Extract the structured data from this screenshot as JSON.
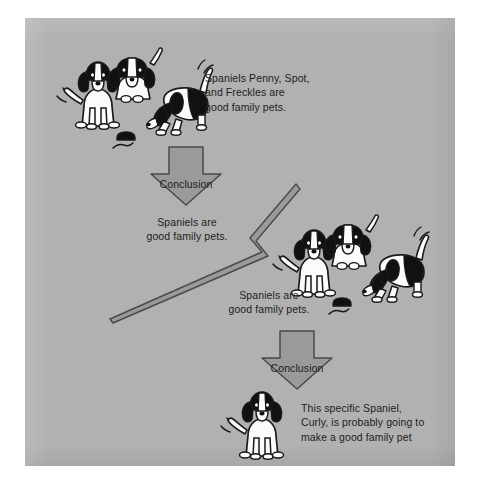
{
  "figure": {
    "background_color": "#ffffff",
    "panel_color": "#b1b1b1",
    "arrow_fill": "#9a9a9a",
    "arrow_stroke": "#4a4a4a",
    "text_color": "#1d1d1d",
    "dog_black": "#111111",
    "dog_white": "#fbfbfb",
    "dog_outline": "#1a1a1a"
  },
  "captions": {
    "premise_1": "Spaniels Penny, Spot,\nand Freckles are\ngood family pets.",
    "conclusion_1": "Spaniels are\ngood family pets.",
    "premise_2": "Spaniels are\ngood family pets.",
    "conclusion_2": "This specific Spaniel,\nCurly, is probably going to\nmake a good family pet"
  },
  "arrows": {
    "conclusion_arrow_1_label": "Conclusion",
    "conclusion_arrow_2_label": "Conclusion",
    "connector_label": ""
  },
  "illustrations": {
    "dog_group_top": "three-spaniels-group-icon",
    "dog_group_middle": "three-spaniels-group-icon",
    "dog_single_bottom": "single-spaniel-icon"
  }
}
